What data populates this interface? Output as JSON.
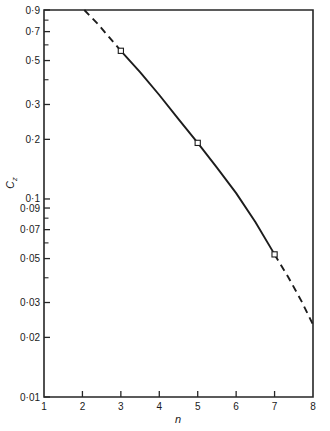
{
  "chart_data": {
    "type": "line",
    "title": "",
    "subtitle": "",
    "xlabel": "n",
    "ylabel": "C",
    "ylabel_subscript": "z",
    "yscale": "log",
    "xscale": "linear",
    "xlim": [
      1,
      8
    ],
    "ylim": [
      0.01,
      0.9
    ],
    "grid": false,
    "legend": null,
    "x_ticks": [
      1,
      2,
      3,
      4,
      5,
      6,
      7,
      8
    ],
    "x_tick_labels": [
      "1",
      "2",
      "3",
      "4",
      "5",
      "6",
      "7",
      "8"
    ],
    "y_ticks": [
      0.9,
      0.7,
      0.5,
      0.3,
      0.2,
      0.1,
      0.09,
      0.07,
      0.05,
      0.03,
      0.02,
      0.01
    ],
    "y_tick_labels": [
      "0·9",
      "0·7",
      "0·5",
      "0·3",
      "0·2",
      "0·1",
      "0·09",
      "0·07",
      "0·05",
      "0·03",
      "0·02",
      "0·01"
    ],
    "y_minor_ticks": [
      0.8,
      0.6,
      0.4,
      0.08,
      0.06,
      0.04
    ],
    "series": [
      {
        "name": "Cz vs n",
        "marker": "open-square",
        "x": [
          2.05,
          3.0,
          4.0,
          5.0,
          6.0,
          7.0,
          8.0
        ],
        "y": [
          0.9,
          0.56,
          0.335,
          0.192,
          0.107,
          0.0525,
          0.0232
        ],
        "segments": [
          {
            "style": "dashed",
            "x": [
              2.05,
              2.4,
              2.7,
              3.0
            ],
            "y": [
              0.9,
              0.765,
              0.655,
              0.56
            ]
          },
          {
            "style": "solid",
            "x": [
              3.0,
              3.5,
              4.0,
              4.5,
              5.0,
              5.5,
              6.0,
              6.5,
              7.0
            ],
            "y": [
              0.56,
              0.437,
              0.335,
              0.253,
              0.192,
              0.144,
              0.107,
              0.0765,
              0.0525
            ]
          },
          {
            "style": "dashed",
            "x": [
              7.0,
              7.35,
              7.7,
              8.0
            ],
            "y": [
              0.0525,
              0.0405,
              0.0305,
              0.0232
            ]
          }
        ],
        "data_points": [
          {
            "n": 3,
            "Cz": 0.56
          },
          {
            "n": 5,
            "Cz": 0.192
          },
          {
            "n": 7,
            "Cz": 0.0525
          }
        ]
      }
    ],
    "annotations": [],
    "colors": {
      "line": "#1c1c1c",
      "axis": "#262626",
      "marker_fill": "#ffffff",
      "background": "#ffffff"
    }
  },
  "axes": {
    "y_axis_name": "y-axis-log",
    "x_axis_name": "x-axis-linear"
  }
}
